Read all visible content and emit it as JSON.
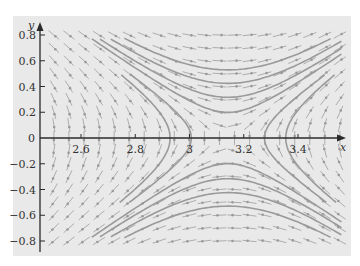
{
  "chart_data": {
    "type": "phase_portrait",
    "title": "",
    "xlabel": "x",
    "ylabel": "y",
    "xlim": [
      2.45,
      3.57
    ],
    "ylim": [
      -0.87,
      0.87
    ],
    "x_ticks": [
      2.6,
      2.8,
      3,
      3.2,
      3.4
    ],
    "x_tick_labels": [
      "2.6",
      "2.8",
      "3",
      "3.2",
      "3.4"
    ],
    "y_ticks": [
      0.8,
      0.6,
      0.4,
      0.2,
      0,
      -0.2,
      -0.4,
      -0.6,
      -0.8
    ],
    "y_tick_labels": [
      "0.8",
      "0.6",
      "0.4",
      "0.2",
      "0",
      "-0.2",
      "-0.4",
      "-0.6",
      "-0.8"
    ],
    "grid": false,
    "legend": null,
    "equilibrium_point": {
      "x": 3.1416,
      "y": 0,
      "kind": "saddle"
    },
    "trajectory_levels": [
      0.02,
      0.05,
      0.09,
      0.14,
      -0.02,
      -0.05
    ]
  },
  "axes": {
    "x_label": "x",
    "y_label": "y"
  },
  "colors": {
    "panel": "#e9e9e9",
    "axis": "#2a2a2a",
    "field": "#9d9d9d",
    "trajectory": "#9a9a9a"
  }
}
